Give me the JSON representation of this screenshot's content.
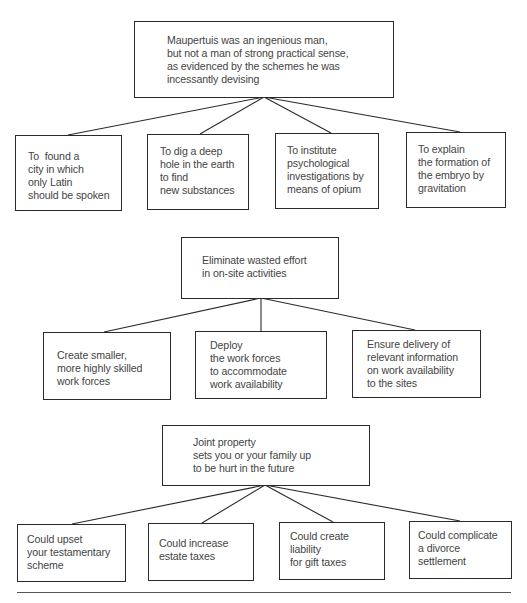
{
  "diagrams": [
    {
      "root": {
        "lines": [
          "Maupertuis was an ingenious man,",
          "but not a man of strong practical sense,",
          "as evidenced by the schemes he was",
          "incessantly devising"
        ]
      },
      "children": [
        {
          "lines": [
            "To  found a",
            "city in which",
            "only Latin",
            "should be spoken"
          ]
        },
        {
          "lines": [
            "To dig a deep",
            "hole in the earth",
            "to find",
            "new substances"
          ]
        },
        {
          "lines": [
            "To institute",
            "psychological",
            "investigations by",
            "means of opium"
          ]
        },
        {
          "lines": [
            "To explain",
            "the formation of",
            "the embryo by",
            "gravitation"
          ]
        }
      ]
    },
    {
      "root": {
        "lines": [
          "Eliminate wasted effort",
          "in on-site activities"
        ]
      },
      "children": [
        {
          "lines": [
            "Create smaller,",
            "more highly skilled",
            "work forces"
          ]
        },
        {
          "lines": [
            "Deploy",
            "the work forces",
            "to accommodate",
            "work availability"
          ]
        },
        {
          "lines": [
            "Ensure delivery of",
            "relevant information",
            "on work availability",
            "to the sites"
          ]
        }
      ]
    },
    {
      "root": {
        "lines": [
          "Joint property",
          "sets you or your family up",
          "to be hurt in the future"
        ]
      },
      "children": [
        {
          "lines": [
            "Could upset",
            "your testamentary",
            "scheme"
          ]
        },
        {
          "lines": [
            "Could increase",
            "estate taxes"
          ]
        },
        {
          "lines": [
            "Could create",
            "liability",
            "for gift taxes"
          ]
        },
        {
          "lines": [
            "Could complicate",
            "a divorce",
            "settlement"
          ]
        }
      ]
    }
  ]
}
